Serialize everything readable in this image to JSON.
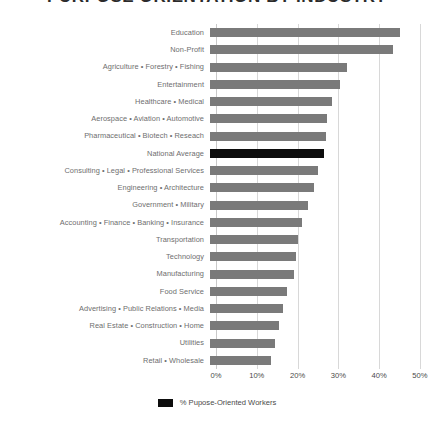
{
  "chart_data": {
    "type": "bar",
    "orientation": "horizontal",
    "title": "PURPOSE ORIENTATION BY INDUSTRY",
    "xlabel": "",
    "ylabel": "",
    "xlim": [
      0,
      52
    ],
    "grid": true,
    "tick_labels": [
      "0%",
      "10%",
      "20%",
      "30%",
      "40%",
      "50%"
    ],
    "tick_values": [
      0,
      10,
      20,
      30,
      40,
      50
    ],
    "legend_position": "bottom-center",
    "legend": [
      "% Pupose-Oriented Workers"
    ],
    "bar_color": "#7a7a7a",
    "highlight_color": "#0d0d0d",
    "highlight_category": "National Average",
    "categories": [
      "Education",
      "Non-Profit",
      "Agriculture • Forestry • Fishing",
      "Entertainment",
      "Healthcare • Medical",
      "Aerospace • Aviation • Automotive",
      "Pharmaceutical • Biotech • Reseach",
      "National Average",
      "Consulting • Legal • Professional Services",
      "Engineering • Architecture",
      "Government • Military",
      "Accounting • Finance • Banking • Insurance",
      "Transportation",
      "Technology",
      "Manufacturing",
      "Food Service",
      "Advertising • Public Relations • Media",
      "Real Estate • Construction • Home",
      "Utilities",
      "Retail • Wholesale"
    ],
    "values": [
      46.5,
      45.0,
      33.5,
      32.0,
      30.0,
      28.8,
      28.5,
      28.0,
      26.5,
      25.5,
      24.0,
      22.5,
      21.5,
      21.0,
      20.5,
      19.0,
      18.0,
      17.0,
      16.0,
      15.0
    ]
  }
}
